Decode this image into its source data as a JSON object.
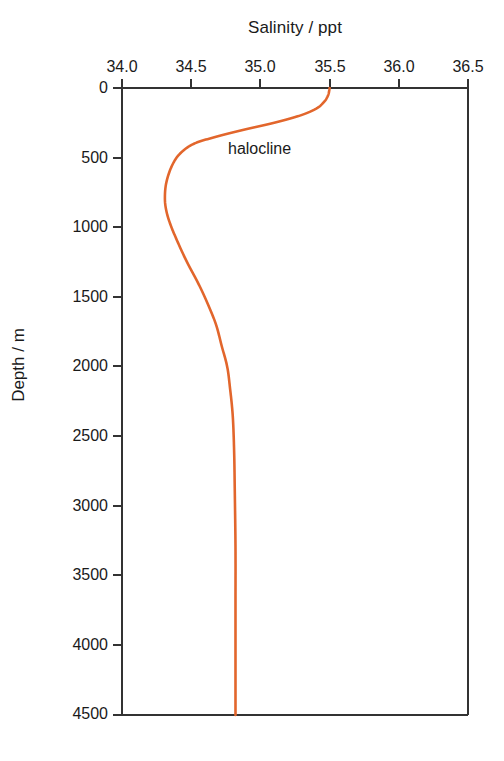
{
  "chart_data": {
    "type": "line",
    "title": "Salinity / ppt",
    "xlabel": "Salinity / ppt",
    "ylabel": "Depth / m",
    "xlim": [
      34.0,
      36.5
    ],
    "ylim": [
      0,
      4500
    ],
    "x_axis_position": "top",
    "y_axis_inverted": true,
    "grid": false,
    "legend": "none",
    "line_color": "#E2662C",
    "xticks": [
      "34.0",
      "34.5",
      "35.0",
      "35.5",
      "36.0",
      "36.5"
    ],
    "xtick_values": [
      34.0,
      34.5,
      35.0,
      35.5,
      36.0,
      36.5
    ],
    "yticks": [
      "0",
      "500",
      "1000",
      "1500",
      "2000",
      "2500",
      "3000",
      "3500",
      "4000",
      "4500"
    ],
    "ytick_values": [
      0,
      500,
      1000,
      1500,
      2000,
      2500,
      3000,
      3500,
      4000,
      4500
    ],
    "series": [
      {
        "name": "Salinity profile",
        "color": "#E2662C",
        "x": [
          35.5,
          35.49,
          35.46,
          35.4,
          35.28,
          35.1,
          34.88,
          34.68,
          34.52,
          34.42,
          34.36,
          34.32,
          34.31,
          34.32,
          34.35,
          34.4,
          34.47,
          34.55,
          34.62,
          34.68,
          34.72,
          34.76,
          34.78,
          34.8,
          34.81,
          34.815,
          34.82,
          34.82,
          34.82,
          34.82
        ],
        "y": [
          0,
          50,
          100,
          150,
          200,
          250,
          300,
          350,
          400,
          470,
          560,
          680,
          790,
          880,
          980,
          1100,
          1250,
          1400,
          1550,
          1700,
          1850,
          2000,
          2150,
          2350,
          2600,
          2900,
          3300,
          3700,
          4100,
          4500
        ],
        "units_x": "ppt",
        "units_y": "m"
      }
    ],
    "annotations": [
      {
        "text": "halocline",
        "x": 35.05,
        "y": 400,
        "px_left": 228,
        "px_top": 140
      }
    ]
  },
  "axis": {
    "title_top": "Salinity / ppt",
    "title_left": "Depth / m"
  }
}
